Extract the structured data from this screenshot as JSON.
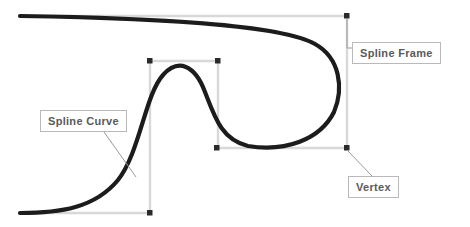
{
  "figure": {
    "background_color": "#ffffff"
  },
  "colors": {
    "curve": "#1c1c1c",
    "frame": "#d8d8d8",
    "vertex": "#2b2b2b",
    "label_text": "#5a5a5a",
    "label_border": "#b9b9b9",
    "leader_line": "#9a9a9a"
  },
  "labels": {
    "spline_frame": "Spline Frame",
    "spline_curve": "Spline Curve",
    "vertex": "Vertex"
  },
  "icons": {
    "vertex_marker": "vertex-square-icon"
  },
  "geometry": {
    "outer_frame": {
      "name": "Spline Frame",
      "left": 217,
      "top": 16,
      "right": 347,
      "bottom": 148
    },
    "inner_frame": {
      "name": "Spline Frame",
      "left": 150,
      "top": 61,
      "right": 218,
      "bottom": 213
    },
    "vertices": [
      {
        "x": 347,
        "y": 16
      },
      {
        "x": 347,
        "y": 148
      },
      {
        "x": 217,
        "y": 148
      },
      {
        "x": 150,
        "y": 61
      },
      {
        "x": 218,
        "y": 61
      },
      {
        "x": 150,
        "y": 213
      }
    ],
    "curve_path": "M 20,213 C 60,213 95,208 118,180 C 140,152 145,95 163,75 C 178,58 195,65 205,92 C 215,118 222,140 248,146 C 285,152 320,140 334,112 C 344,88 340,58 315,44 C 280,24 150,18 20,16",
    "leader_lines": [
      {
        "name": "spline-frame-leader",
        "x1": 347,
        "y1": 18,
        "x2": 347,
        "y2": 48,
        "x3": 352,
        "y3": 48
      },
      {
        "name": "spline-curve-leader",
        "x1": 104,
        "y1": 132,
        "x2": 136,
        "y2": 176
      },
      {
        "name": "vertex-leader",
        "x1": 347,
        "y1": 150,
        "x2": 372,
        "y2": 176
      }
    ]
  }
}
